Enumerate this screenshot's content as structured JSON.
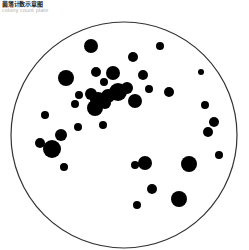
{
  "header": {
    "title": "菌落计数示意图",
    "subtitle": "colony count plate"
  },
  "plate": {
    "cx": 124,
    "cy": 135,
    "r": 113,
    "stroke": "#333333",
    "colony_color": "#000000"
  },
  "colonies": [
    [
      91,
      46,
      7
    ],
    [
      160,
      46,
      4
    ],
    [
      133,
      57,
      5
    ],
    [
      66,
      78,
      8
    ],
    [
      96,
      72,
      5
    ],
    [
      113,
      73,
      7
    ],
    [
      104,
      82,
      4
    ],
    [
      143,
      75,
      5
    ],
    [
      201,
      72,
      3
    ],
    [
      79,
      95,
      4
    ],
    [
      75,
      104,
      4
    ],
    [
      91,
      94,
      6
    ],
    [
      98,
      100,
      8
    ],
    [
      108,
      96,
      7
    ],
    [
      118,
      92,
      9
    ],
    [
      95,
      108,
      8
    ],
    [
      105,
      103,
      6
    ],
    [
      127,
      88,
      6
    ],
    [
      149,
      89,
      4
    ],
    [
      135,
      101,
      7
    ],
    [
      169,
      92,
      5
    ],
    [
      103,
      125,
      4
    ],
    [
      45,
      115,
      4
    ],
    [
      78,
      127,
      4
    ],
    [
      61,
      135,
      6
    ],
    [
      40,
      143,
      5
    ],
    [
      52,
      149,
      9
    ],
    [
      64,
      167,
      4
    ],
    [
      205,
      105,
      4
    ],
    [
      214,
      122,
      5
    ],
    [
      208,
      132,
      5
    ],
    [
      219,
      155,
      4
    ],
    [
      189,
      164,
      8
    ],
    [
      135,
      165,
      4
    ],
    [
      145,
      163,
      7
    ],
    [
      152,
      189,
      5
    ],
    [
      179,
      199,
      8
    ],
    [
      137,
      205,
      4
    ]
  ],
  "colony_count": 38
}
